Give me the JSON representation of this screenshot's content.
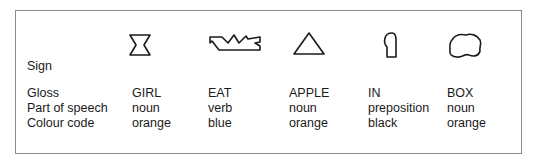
{
  "row_labels": {
    "sign": "Sign",
    "gloss": "Gloss",
    "part_of_speech": "Part of speech",
    "colour_code": "Colour code"
  },
  "signs": [
    {
      "icon": "hourglass-shape-icon",
      "gloss": "GIRL",
      "part_of_speech": "noun",
      "colour_code": "orange"
    },
    {
      "icon": "jagged-bar-shape-icon",
      "gloss": "EAT",
      "part_of_speech": "verb",
      "colour_code": "blue"
    },
    {
      "icon": "triangle-shape-icon",
      "gloss": "APPLE",
      "part_of_speech": "noun",
      "colour_code": "orange"
    },
    {
      "icon": "bent-tab-shape-icon",
      "gloss": "IN",
      "part_of_speech": "preposition",
      "colour_code": "black"
    },
    {
      "icon": "blob-shape-icon",
      "gloss": "BOX",
      "part_of_speech": "noun",
      "colour_code": "orange"
    }
  ],
  "colors": {
    "border": "#8a8a8a",
    "ink": "#1a1a1a",
    "background": "#ffffff"
  }
}
